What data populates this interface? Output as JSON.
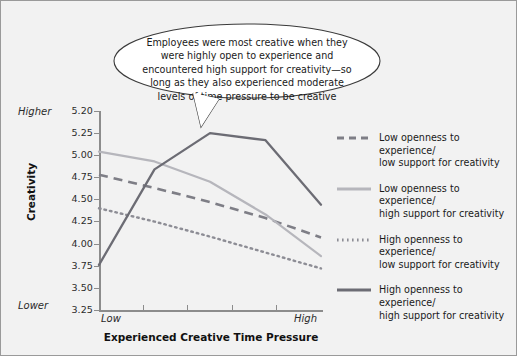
{
  "callout": {
    "text": "Employees were most creative when they were highly open to experience and encountered high support for creativity—so long as they also experienced moderate levels of time pressure to be creative"
  },
  "axes": {
    "y_title": "Creativity",
    "x_title": "Experienced Creative Time Pressure",
    "y_high_note": "Higher",
    "y_low_note": "Lower",
    "x_tick_labels": [
      "Low",
      "High"
    ],
    "y_tick_labels": [
      "5.20",
      "5.25",
      "5.00",
      "4.75",
      "4.50",
      "4.25",
      "4.00",
      "3.75",
      "3.50",
      "3.25"
    ]
  },
  "legend": {
    "items": [
      {
        "label": "Low openness to experience/\nlow support for creativity",
        "style": "dashed",
        "color": "#7e7e86"
      },
      {
        "label": "Low openness to experience/\nhigh support for creativity",
        "style": "solid",
        "color": "#b6b6bc"
      },
      {
        "label": "High openness to experience/\nlow support for creativity",
        "style": "dotted",
        "color": "#8d8d95"
      },
      {
        "label": "High openness to experience/\nhigh support for creativity",
        "style": "solid",
        "color": "#6c6c74"
      }
    ]
  },
  "colors": {
    "background": "#f2f2f2",
    "border": "#9a9a9a",
    "axis": "#8c8c8c",
    "text": "#1a1a1a"
  },
  "chart_data": {
    "type": "line",
    "title": "",
    "xlabel": "Experienced Creative Time Pressure",
    "ylabel": "Creativity",
    "x": [
      1,
      2,
      3,
      4,
      5
    ],
    "x_tick_labels": [
      "Low",
      "",
      "",
      "",
      "High"
    ],
    "ylim": [
      3.25,
      5.5
    ],
    "yticks": [
      3.25,
      3.5,
      3.75,
      4.0,
      4.25,
      4.5,
      4.75,
      5.0,
      5.25,
      5.5
    ],
    "ytick_labels": [
      "3.25",
      "3.50",
      "3.75",
      "4.00",
      "4.25",
      "4.50",
      "4.75",
      "5.00",
      "5.25",
      "5.20"
    ],
    "grid": false,
    "legend_position": "right",
    "series": [
      {
        "name": "Low openness to experience/low support for creativity",
        "style": "dashed",
        "color": "#7e7e86",
        "values": [
          4.78,
          4.63,
          4.47,
          4.29,
          4.07
        ]
      },
      {
        "name": "Low openness to experience/high support for creativity",
        "style": "solid",
        "color": "#b6b6bc",
        "values": [
          5.04,
          4.93,
          4.7,
          4.33,
          3.86
        ]
      },
      {
        "name": "High openness to experience/low support for creativity",
        "style": "dotted",
        "color": "#8d8d95",
        "values": [
          4.4,
          4.25,
          4.08,
          3.9,
          3.72
        ]
      },
      {
        "name": "High openness to experience/high support for creativity",
        "style": "solid",
        "color": "#6c6c74",
        "values": [
          3.76,
          4.84,
          5.25,
          5.17,
          4.44
        ]
      }
    ]
  }
}
